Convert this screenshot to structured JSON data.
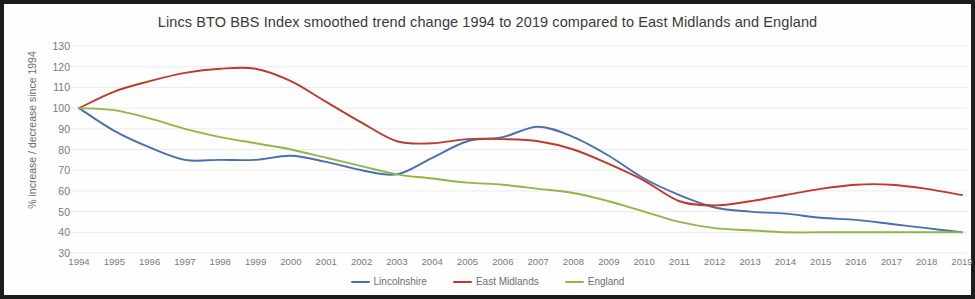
{
  "chart_data": {
    "type": "line",
    "title": "Lincs BTO BBS Index smoothed trend change 1994 to 2019 compared to East Midlands and England",
    "xlabel": "",
    "ylabel": "% increase / decrease since 1994",
    "grid": true,
    "legend_position": "bottom",
    "xlim": [
      1994,
      2019
    ],
    "ylim": [
      30,
      130
    ],
    "ytick_step": 10,
    "x": [
      1994,
      1995,
      1996,
      1997,
      1998,
      1999,
      2000,
      2001,
      2002,
      2003,
      2004,
      2005,
      2006,
      2007,
      2008,
      2009,
      2010,
      2011,
      2012,
      2013,
      2014,
      2015,
      2016,
      2017,
      2018,
      2019
    ],
    "categories": [
      "1994",
      "1995",
      "1996",
      "1997",
      "1998",
      "1999",
      "2000",
      "2001",
      "2002",
      "2003",
      "2004",
      "2005",
      "2006",
      "2007",
      "2008",
      "2009",
      "2010",
      "2011",
      "2012",
      "2013",
      "2014",
      "2015",
      "2016",
      "2017",
      "2018",
      "2019"
    ],
    "yticks": [
      130,
      120,
      110,
      100,
      90,
      80,
      70,
      60,
      50,
      40,
      30
    ],
    "series": [
      {
        "name": "Lincolnshire",
        "color": "#4a6fb0",
        "values": [
          100,
          89,
          81,
          75,
          75,
          75,
          77,
          74,
          70,
          68,
          76,
          84,
          86,
          91,
          86,
          77,
          66,
          58,
          52,
          50,
          49,
          47,
          46,
          44,
          42,
          40
        ]
      },
      {
        "name": "East Midlands",
        "color": "#c0392b",
        "values": [
          100,
          108,
          113,
          117,
          119,
          119,
          113,
          103,
          93,
          84,
          83,
          85,
          85,
          84,
          80,
          73,
          65,
          55,
          53,
          55,
          58,
          61,
          63,
          63,
          61,
          58
        ]
      },
      {
        "name": "England",
        "color": "#8cb843",
        "values": [
          100,
          99,
          95,
          90,
          86,
          83,
          80,
          76,
          72,
          68,
          66,
          64,
          63,
          61,
          59,
          55,
          50,
          45,
          42,
          41,
          40,
          40,
          40,
          40,
          40,
          40
        ]
      }
    ]
  },
  "legend": {
    "items": [
      {
        "label": "Lincolnshire",
        "color": "#4a6fb0"
      },
      {
        "label": "East Midlands",
        "color": "#c0392b"
      },
      {
        "label": "England",
        "color": "#8cb843"
      }
    ]
  },
  "colors": {
    "lincolnshire": "#4a6fb0",
    "east_midlands": "#c0392b",
    "england": "#8cb843",
    "gridline": "#eceaea",
    "axis_text": "#7a7a7a",
    "title_text": "#3a3a3a",
    "border": "#1c1c1c"
  }
}
